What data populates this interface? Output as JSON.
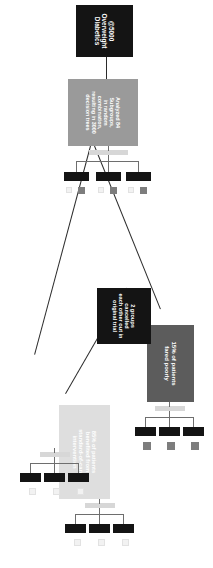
{
  "diagram": {
    "orientation": "rotated-90",
    "colors": {
      "root_node": "#141414",
      "method_node": "#9a9a9a",
      "poor_outcome_node": "#5c5c5c",
      "cancelled_node": "#141414",
      "benefit_node": "#dedede",
      "leaf": "#141414",
      "chip": "#7d7d7d",
      "chip_faint": "#f2f2f2",
      "connector_bar": "#d7d7d7",
      "edge": "#2b2b2b",
      "text": "#ffffff",
      "background": "#ffffff"
    }
  },
  "nodes": {
    "root": {
      "id": "root",
      "line1": "@5000",
      "line2": "Overweight Diabetics",
      "style": "dark"
    },
    "method": {
      "id": "method",
      "line1": "Analyzed 84 Subgroups,",
      "line2": "in random combination,",
      "line3": "resulting in 3000 decision trees",
      "style": "gray"
    },
    "poor": {
      "id": "poor-outcome",
      "line1": "15% of patients",
      "line2": "fared poorly",
      "style": "mid"
    },
    "cancelled": {
      "id": "cancelled",
      "line1": "2 groups cancelled",
      "line2": "each other out in",
      "line3": "original trial",
      "style": "dark"
    },
    "benefit": {
      "id": "benefit",
      "line1": "85% of patients",
      "line2": "benefited from",
      "line3": "standard-of-care",
      "line4": "intervention",
      "style": "light"
    }
  },
  "leaf_clusters": [
    {
      "id": "method-leaves",
      "parent": "method",
      "count": 3,
      "has_connector_bar": true,
      "leaves": [
        {
          "id": "method-leaf-1",
          "chip": "gray",
          "faint_chip": true
        },
        {
          "id": "method-leaf-2",
          "chip": "gray",
          "faint_chip": true
        },
        {
          "id": "method-leaf-3",
          "chip": "gray",
          "faint_chip": true
        }
      ]
    },
    {
      "id": "poor-leaves",
      "parent": "poor-outcome",
      "count": 3,
      "has_connector_bar": true,
      "leaves": [
        {
          "id": "poor-leaf-1",
          "chip": "gray",
          "faint_chip": false
        },
        {
          "id": "poor-leaf-2",
          "chip": "gray",
          "faint_chip": false
        },
        {
          "id": "poor-leaf-3",
          "chip": "gray",
          "faint_chip": false
        }
      ]
    },
    {
      "id": "benefit-leaves-upper",
      "parent": "benefit",
      "count": 3,
      "has_connector_bar": true,
      "leaves": [
        {
          "id": "benefit-leaf-1",
          "chip": "faint",
          "faint_chip": true
        },
        {
          "id": "benefit-leaf-2",
          "chip": "faint",
          "faint_chip": true
        },
        {
          "id": "benefit-leaf-3",
          "chip": "faint",
          "faint_chip": true
        }
      ]
    },
    {
      "id": "benefit-leaves-lower",
      "parent": "benefit",
      "count": 3,
      "has_connector_bar": true,
      "leaves": [
        {
          "id": "benefit-leaf-4",
          "chip": "faint",
          "faint_chip": true
        },
        {
          "id": "benefit-leaf-5",
          "chip": "faint",
          "faint_chip": true
        },
        {
          "id": "benefit-leaf-6",
          "chip": "faint",
          "faint_chip": true
        }
      ]
    }
  ],
  "edges": [
    {
      "from": "root",
      "to": "method"
    },
    {
      "from": "method",
      "to": "poor-outcome"
    },
    {
      "from": "method",
      "to": "benefit"
    },
    {
      "from": "cancelled",
      "to": "benefit"
    }
  ]
}
